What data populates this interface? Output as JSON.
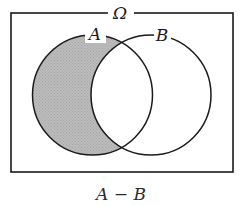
{
  "figure": {
    "name": "venn-diagram-set-difference",
    "universe_label": "Ω",
    "set_a_label": "A",
    "set_b_label": "B",
    "caption": "A − B",
    "shaded_region": "A minus B",
    "colors": {
      "stroke": "#1a1a1a",
      "shade": "#b5b5b5",
      "background": "#ffffff",
      "caption": "#2b2b2b"
    },
    "geometry": {
      "rect": {
        "x": 11,
        "y": 13,
        "width": 222,
        "height": 159
      },
      "circle_a": {
        "cx": 92.5,
        "cy": 95,
        "r": 60
      },
      "circle_b": {
        "cx": 151,
        "cy": 95,
        "r": 60
      }
    },
    "label_positions": {
      "omega": {
        "x": 120,
        "y": 18
      },
      "a": {
        "x": 95,
        "y": 39
      },
      "b": {
        "x": 162,
        "y": 40
      },
      "caption": {
        "x": 121.5,
        "y": 199
      }
    }
  }
}
